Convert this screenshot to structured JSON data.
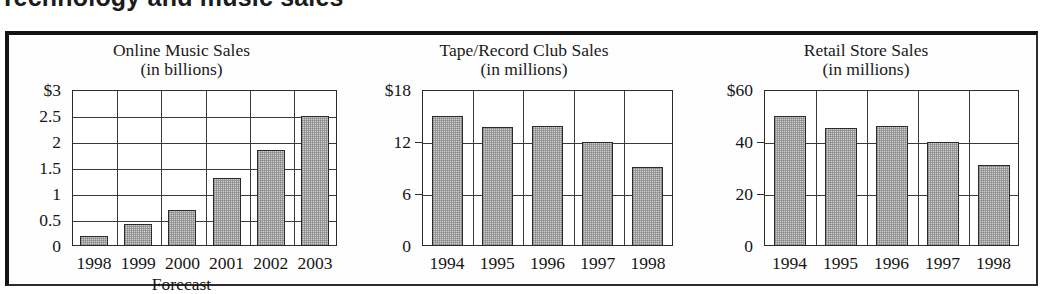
{
  "headline": "Technology and music sales",
  "figure": {
    "frame_color": "#141414",
    "bar_fill": "#cfcfcf",
    "bar_stroke": "#2b2b2b"
  },
  "chart_data": [
    {
      "type": "bar",
      "title": "Online Music Sales",
      "subtitle": "(in billions)",
      "xlabel": "Forecast",
      "ylabel": "",
      "categories": [
        "1998",
        "1999",
        "2000",
        "2001",
        "2002",
        "2003"
      ],
      "values": [
        0.2,
        0.42,
        0.7,
        1.3,
        1.85,
        2.5
      ],
      "ylim": [
        0,
        3
      ],
      "yticks": [
        0,
        0.5,
        1,
        1.5,
        2,
        2.5,
        3
      ],
      "yticklabels": [
        "0",
        "0.5",
        "1",
        "1.5",
        "2",
        "2.5",
        "$3"
      ],
      "grid": true,
      "legend": "none"
    },
    {
      "type": "bar",
      "title": "Tape/Record Club Sales",
      "subtitle": "(in millions)",
      "xlabel": "",
      "ylabel": "",
      "categories": [
        "1994",
        "1995",
        "1996",
        "1997",
        "1998"
      ],
      "values": [
        15.0,
        13.7,
        13.9,
        12.0,
        9.1
      ],
      "ylim": [
        0,
        18
      ],
      "yticks": [
        0,
        6,
        12,
        18
      ],
      "yticklabels": [
        "0",
        "6",
        "12",
        "$18"
      ],
      "grid": true,
      "legend": "none"
    },
    {
      "type": "bar",
      "title": "Retail Store Sales",
      "subtitle": "(in millions)",
      "xlabel": "",
      "ylabel": "",
      "categories": [
        "1994",
        "1995",
        "1996",
        "1997",
        "1998"
      ],
      "values": [
        50.0,
        45.5,
        46.0,
        40.0,
        31.0
      ],
      "ylim": [
        0,
        60
      ],
      "yticks": [
        0,
        20,
        40,
        60
      ],
      "yticklabels": [
        "0",
        "20",
        "40",
        "$60"
      ],
      "grid": true,
      "legend": "none"
    }
  ]
}
